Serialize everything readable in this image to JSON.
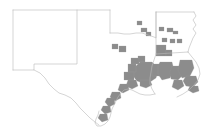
{
  "figure": {
    "title": "",
    "type": "county-choropleth-map",
    "region": "South Central United States",
    "background_color": "#ffffff",
    "width": 217,
    "height": 139
  },
  "style": {
    "highlight_fill": "#8c8c8c",
    "highlight_stroke": "#9a9a9a",
    "state_fill": "#ffffff",
    "state_stroke": "#b9b9b9",
    "county_stroke": "#c9c9c9"
  },
  "chart_data": {
    "type": "map",
    "map_kind": "choropleth",
    "title": "",
    "subtitle": "",
    "xlabel": "",
    "ylabel": "",
    "legend": [],
    "annotations": [],
    "grid": false,
    "classes": [
      {
        "label": "highlighted",
        "color": "#8c8c8c"
      },
      {
        "label": "not highlighted",
        "color": "#ffffff"
      }
    ],
    "states": [
      {
        "name": "New Mexico",
        "highlighted_count": 0
      },
      {
        "name": "Texas",
        "highlighted_count": 31
      },
      {
        "name": "Oklahoma",
        "highlighted_count": 4
      },
      {
        "name": "Arkansas",
        "highlighted_count": 6
      },
      {
        "name": "Louisiana",
        "highlighted_count": 19
      }
    ],
    "clusters": [
      {
        "name": "Houston / Southeast Texas",
        "density": "high"
      },
      {
        "name": "Southwest Louisiana",
        "density": "high"
      },
      {
        "name": "Baton Rouge / New Orleans corridor",
        "density": "high"
      },
      {
        "name": "Texas Coastal Bend",
        "density": "medium"
      },
      {
        "name": "East Texas / Arklatex",
        "density": "low"
      },
      {
        "name": "Central Arkansas",
        "density": "low"
      },
      {
        "name": "Southeast Oklahoma",
        "density": "low"
      }
    ]
  },
  "geometry": {
    "state_paths": [
      {
        "name": "new-mexico",
        "d": "M 13,10 L 77,10 L 77,64 L 34,64 L 34,70 L 13,70 Z"
      },
      {
        "name": "texas",
        "d": "M 77,10 L 110,10 L 110,33 L 143,33 L 146,36 L 152,37 L 158,40 L 163,40 L 168,44 L 172,47 L 174,52 L 176,56 L 176,61 L 172,66 L 168,70 L 163,74 L 158,78 L 152,81 L 146,84 L 140,85 L 134,86 L 128,88 L 124,92 L 122,97 L 120,101 L 118,105 L 116,108 L 114,112 L 112,116 L 110,119 L 106,122 L 101,124 L 96,124 L 92,122 L 88,119 L 84,116 L 81,112 L 78,108 L 75,104 L 72,100 L 69,97 L 65,95 L 61,94 L 57,93 L 54,90 L 51,87 L 48,83 L 46,79 L 44,75 L 41,72 L 38,69 L 34,66 L 34,64 L 77,64 Z"
      },
      {
        "name": "oklahoma",
        "d": "M 77,10 L 110,10 L 110,33 L 156,33 L 156,12 L 110,12 L 110,10 Z"
      },
      {
        "name": "arkansas",
        "d": "M 156,12 L 194,12 L 196,18 L 194,24 L 196,30 L 194,36 L 192,42 L 190,48 L 188,52 L 184,54 L 179,54 L 174,54 L 170,54 L 166,54 L 162,54 L 158,54 L 156,52 Z"
      },
      {
        "name": "louisiana",
        "d": "M 156,54 L 188,52 L 192,56 L 196,60 L 198,66 L 200,72 L 200,78 L 196,84 L 192,88 L 186,92 L 180,95 L 174,97 L 168,98 L 162,98 L 157,96 L 153,93 L 150,89 L 149,84 L 150,78 L 152,72 L 154,64 Z"
      }
    ],
    "state_border_lines": [
      {
        "name": "nm-tx-border",
        "d": "M 77,10 L 77,64 L 34,64 L 34,70 L 13,70"
      },
      {
        "name": "nm-north",
        "d": "M 13,10 L 110,10"
      },
      {
        "name": "nm-west",
        "d": "M 13,10 L 13,70"
      },
      {
        "name": "ok-tx-panhandle",
        "d": "M 110,10 L 110,33"
      },
      {
        "name": "ok-south",
        "d": "M 110,33 L 118,33 L 124,34 L 130,34 L 136,33 L 142,33 L 148,35 L 154,37 L 156,38 L 156,12"
      },
      {
        "name": "ok-ar-border",
        "d": "M 156,12 L 156,54"
      },
      {
        "name": "ar-north",
        "d": "M 156,12 L 194,12"
      },
      {
        "name": "ar-east-mississippi",
        "d": "M 194,12 L 196,16 L 193,20 L 196,25 L 193,29 L 196,33 L 193,38 L 191,43 L 189,48 L 188,52"
      },
      {
        "name": "ar-la-border",
        "d": "M 156,54 L 188,52"
      },
      {
        "name": "la-east",
        "d": "M 188,52 L 192,57 L 196,62 L 199,68 L 200,74 L 198,80 L 194,85 L 189,90 L 183,94 L 177,97"
      },
      {
        "name": "tx-la-border",
        "d": "M 156,54 L 154,60 L 152,66 L 151,72 L 150,78 L 150,84 L 152,89 L 155,94"
      },
      {
        "name": "tx-coast",
        "d": "M 155,94 L 150,95 L 145,95 L 140,94 L 136,92 L 132,90 L 128,89 L 124,90 L 121,93 L 118,97 L 116,101 L 114,105 L 112,109 L 111,113 L 110,117 L 108,121 L 105,124 L 101,126 L 97,126 L 95,123 L 96,119 L 98,115 L 99,111"
      },
      {
        "name": "tx-mexico-border",
        "d": "M 34,70 L 40,73 L 45,78 L 49,84 L 54,89 L 59,93 L 65,95 L 71,98 L 76,103 L 80,108 L 85,113 L 90,118 L 95,122 L 99,125"
      }
    ],
    "highlighted_counties": [
      {
        "name": "county-hl-se-oklahoma-1",
        "d": "M 137,21 L 142,21 L 142,25 L 137,25 Z"
      },
      {
        "name": "county-hl-se-oklahoma-2",
        "d": "M 141,28 L 147,28 L 147,32 L 141,32 Z"
      },
      {
        "name": "county-hl-se-oklahoma-3",
        "d": "M 146,32 L 151,32 L 151,36 L 146,36 Z"
      },
      {
        "name": "county-hl-ar-1",
        "d": "M 159,27 L 164,27 L 164,31 L 159,31 Z"
      },
      {
        "name": "county-hl-ar-2",
        "d": "M 167,28 L 173,28 L 173,32 L 167,32 Z"
      },
      {
        "name": "county-hl-ar-3",
        "d": "M 173,31 L 178,31 L 178,34 L 173,34 Z"
      },
      {
        "name": "county-hl-ar-4",
        "d": "M 162,38 L 167,38 L 167,42 L 162,42 Z"
      },
      {
        "name": "county-hl-ar-5",
        "d": "M 170,39 L 175,39 L 175,43 L 170,43 Z"
      },
      {
        "name": "county-hl-ar-6",
        "d": "M 177,39 L 182,39 L 182,43 L 177,43 Z"
      },
      {
        "name": "county-hl-east-tx-1",
        "d": "M 119,46 L 126,46 L 126,52 L 119,52 Z"
      },
      {
        "name": "county-hl-east-tx-2",
        "d": "M 138,56 L 145,56 L 145,62 L 138,62 Z"
      },
      {
        "name": "county-hl-nw-la-1",
        "d": "M 156,45 L 166,45 L 166,56 L 156,56 Z"
      },
      {
        "name": "county-hl-nw-la-2",
        "d": "M 166,50 L 172,50 L 172,56 L 166,56 Z"
      },
      {
        "name": "county-hl-houston-core",
        "d": "M 140,62 L 152,62 L 156,66 L 158,72 L 156,78 L 150,82 L 143,83 L 137,81 L 133,76 L 133,69 Z"
      },
      {
        "name": "county-hl-houston-w",
        "d": "M 128,64 L 136,64 L 136,72 L 128,72 Z"
      },
      {
        "name": "county-hl-houston-nw",
        "d": "M 131,58 L 139,58 L 139,64 L 131,64 Z"
      },
      {
        "name": "county-hl-houston-sw",
        "d": "M 124,72 L 134,72 L 134,80 L 124,80 Z"
      },
      {
        "name": "county-hl-beaumont",
        "d": "M 152,64 L 162,64 L 162,76 L 152,76 Z"
      },
      {
        "name": "county-hl-galveston",
        "d": "M 140,80 L 150,80 L 152,85 L 146,88 L 140,86 Z"
      },
      {
        "name": "county-hl-sw-la-1",
        "d": "M 160,62 L 172,62 L 174,70 L 170,78 L 162,80 L 158,74 L 158,66 Z"
      },
      {
        "name": "county-hl-sw-la-2",
        "d": "M 172,66 L 182,66 L 184,74 L 178,80 L 171,79 L 170,72 Z"
      },
      {
        "name": "county-hl-baton-rouge",
        "d": "M 180,60 L 192,60 L 194,68 L 190,76 L 182,78 L 178,70 Z"
      },
      {
        "name": "county-hl-new-orleans",
        "d": "M 186,76 L 196,76 L 198,82 L 193,87 L 186,86 L 183,81 Z"
      },
      {
        "name": "county-hl-la-coast-1",
        "d": "M 174,80 L 182,80 L 184,86 L 178,90 L 172,87 Z"
      },
      {
        "name": "county-hl-la-coast-2",
        "d": "M 190,86 L 198,86 L 199,91 L 193,93 L 188,90 Z"
      },
      {
        "name": "county-hl-matagorda",
        "d": "M 128,80 L 136,80 L 138,86 L 132,89 L 126,86 Z"
      },
      {
        "name": "county-hl-victoria",
        "d": "M 120,84 L 128,84 L 129,90 L 123,93 L 118,90 Z"
      },
      {
        "name": "county-hl-corpus-1",
        "d": "M 112,92 L 120,92 L 121,98 L 115,101 L 110,97 Z"
      },
      {
        "name": "county-hl-corpus-2",
        "d": "M 107,98 L 114,98 L 115,104 L 109,107 L 105,102 Z"
      },
      {
        "name": "county-hl-corpus-3",
        "d": "M 103,106 L 110,106 L 111,112 L 105,114 L 101,110 Z"
      },
      {
        "name": "county-hl-brownsville",
        "d": "M 100,114 L 107,114 L 108,120 L 102,122 L 98,118 Z"
      },
      {
        "name": "county-hl-central-tx",
        "d": "M 112,44 L 118,44 L 118,49 L 112,49 Z"
      }
    ]
  }
}
